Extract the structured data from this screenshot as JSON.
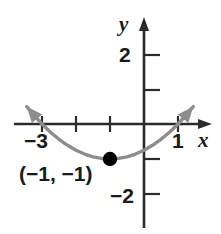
{
  "figure": {
    "background_color": "#ffffff",
    "axis_color": "#2b2b2b",
    "curve_color": "#8d8d8d",
    "point_color": "#000000",
    "label_color": "#1a1a1a"
  },
  "axes": {
    "x_label": "x",
    "y_label": "y",
    "x_tick_labels": [
      "−3",
      "1"
    ],
    "y_tick_labels": [
      "2",
      "−2"
    ]
  },
  "annotations": {
    "vertex_label": "(−1, −1)"
  },
  "chart_data": {
    "type": "line",
    "title": "",
    "xlabel": "x",
    "ylabel": "y",
    "xlim": [
      -3.8,
      1.6
    ],
    "ylim": [
      -2.8,
      2.5
    ],
    "grid": false,
    "legend": null,
    "curves": [
      {
        "name": "parabola",
        "equation": "y = 0.25(x + 1)^2 - 1",
        "color": "#8d8d8d",
        "arrow_ends": [
          "left",
          "right"
        ],
        "x": [
          -3.45,
          -3.25,
          -3.0,
          -2.75,
          -2.5,
          -2.25,
          -2.0,
          -1.75,
          -1.5,
          -1.25,
          -1.0,
          -0.75,
          -0.5,
          -0.25,
          0.0,
          0.25,
          0.5,
          0.75,
          1.0,
          1.25,
          1.45
        ],
        "y": [
          0.5,
          0.27,
          0.0,
          -0.234,
          -0.4375,
          -0.609,
          -0.75,
          -0.859,
          -0.9375,
          -0.984,
          -1.0,
          -0.984,
          -0.9375,
          -0.859,
          -0.75,
          -0.609,
          -0.4375,
          -0.234,
          0.0,
          0.266,
          0.5
        ]
      }
    ],
    "points": [
      {
        "name": "vertex",
        "x": -1,
        "y": -1,
        "label": "(−1, −1)",
        "filled": true
      }
    ],
    "x_ticks": [
      {
        "value": -3,
        "label": "−3"
      },
      {
        "value": -2,
        "label": ""
      },
      {
        "value": -1,
        "label": ""
      },
      {
        "value": 1,
        "label": "1"
      }
    ],
    "y_ticks": [
      {
        "value": 2,
        "label": "2"
      },
      {
        "value": 1,
        "label": ""
      },
      {
        "value": -1,
        "label": ""
      },
      {
        "value": -2,
        "label": "−2"
      }
    ]
  }
}
